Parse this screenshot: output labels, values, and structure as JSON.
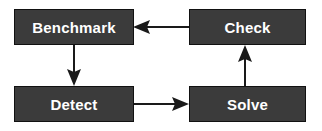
{
  "diagram": {
    "background_color": "#ffffff",
    "node_fill_color": "#3b3b3b",
    "node_border_color": "#111111",
    "node_text_color": "#ffffff",
    "edge_color": "#1a1a1a",
    "nodes": [
      {
        "id": "benchmark",
        "label": "Benchmark"
      },
      {
        "id": "check",
        "label": "Check"
      },
      {
        "id": "detect",
        "label": "Detect"
      },
      {
        "id": "solve",
        "label": "Solve"
      }
    ],
    "edges": [
      {
        "id": "check-to-benchmark",
        "from": "Check",
        "to": "Benchmark",
        "direction": "left"
      },
      {
        "id": "benchmark-to-detect",
        "from": "Benchmark",
        "to": "Detect",
        "direction": "down"
      },
      {
        "id": "detect-to-solve",
        "from": "Detect",
        "to": "Solve",
        "direction": "right"
      },
      {
        "id": "solve-to-check",
        "from": "Solve",
        "to": "Check",
        "direction": "up"
      }
    ]
  }
}
